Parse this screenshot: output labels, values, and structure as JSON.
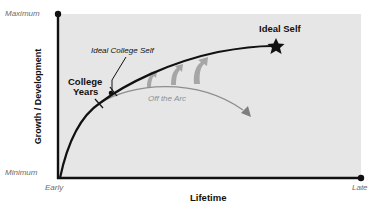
{
  "diagram": {
    "type": "growth-arc",
    "axes": {
      "y_label": "Growth / Development",
      "y_max_label": "Maximum",
      "y_min_label": "Minimum",
      "x_label": "Lifetime",
      "x_start_label": "Early",
      "x_end_label": "Late"
    },
    "annotations": {
      "college_years": "College\nYears",
      "college_years_line1": "College",
      "college_years_line2": "Years",
      "ideal_college_self": "Ideal College Self",
      "ideal_self": "Ideal Self",
      "off_the_arc": "Off the Arc"
    },
    "colors": {
      "panel": "#e6e6e6",
      "axis": "#111111",
      "main_curve": "#111111",
      "off_arc": "#8e8e8e",
      "arrows": "#a3a3a3",
      "muted_text": "#6b6b6b"
    }
  }
}
